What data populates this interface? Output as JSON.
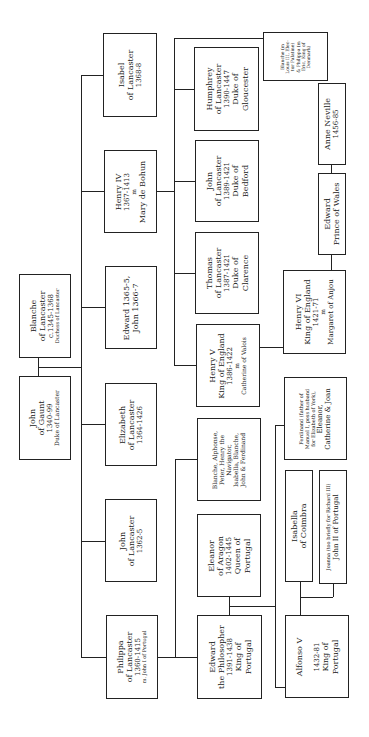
{
  "diagram": {
    "type": "family-tree",
    "orientation": "rotated-90-ccw",
    "line_color": "#222222",
    "background": "#ffffff"
  },
  "generation1": {
    "john_of_gaunt": {
      "lines": [
        "John",
        "of Gaunt",
        "1340-99",
        "Duke of Lancaster"
      ]
    },
    "blanche": {
      "lines": [
        "Blanche",
        "of Lancaster",
        "c.1345-1368",
        "Duchess of Lancaster"
      ]
    }
  },
  "generation2": {
    "philippa": {
      "lines": [
        "Philippa",
        "of Lancaster",
        "1360-1415"
      ],
      "note": "m. John I of Portugal"
    },
    "john_1362": {
      "lines": [
        "John",
        "of Lancaster",
        "1362-5"
      ]
    },
    "elizabeth": {
      "lines": [
        "Elizabeth",
        "of Lancaster",
        "1364-1426"
      ]
    },
    "edward_john": {
      "lines": [
        "Edward 1365-5,",
        "John 1366-7"
      ]
    },
    "henry_iv": {
      "lines": [
        "Henry IV",
        "1367-1413",
        "m",
        "Mary de Bohun"
      ]
    },
    "isabel": {
      "lines": [
        "Isabel",
        "of Lancaster",
        "1368-8"
      ]
    }
  },
  "generation3": {
    "edward_philosopher": {
      "lines": [
        "Edward",
        "the Philosopher",
        "1391-1438",
        "King of",
        "Portugal"
      ]
    },
    "eleanor_aragon": {
      "lines": [
        "Eleanor",
        "of Aragon",
        "1402-1445",
        "Queen of",
        "Portugal"
      ]
    },
    "portugal_siblings": {
      "lines": [
        "Blanche, Alphonse,",
        "Peter, Henry the",
        "Navigator,",
        "Isabella, Blanche,",
        "John & Ferdinand"
      ]
    },
    "henry_v": {
      "lines": [
        "Henry V",
        "King of England",
        "1386-1422",
        "m",
        "Catherine of Valois"
      ]
    },
    "thomas": {
      "lines": [
        "Thomas",
        "of Lancaster",
        "1387-1421",
        "Duke of",
        "Clarence"
      ]
    },
    "john_bedford": {
      "lines": [
        "John",
        "of Lancaster",
        "1389-1421",
        "Duke of",
        "Bedford"
      ]
    },
    "humphrey": {
      "lines": [
        "Humphrey",
        "of Lancaster",
        "1390-1447",
        "Duke of",
        "Gloucester"
      ]
    },
    "blanche_philippa": {
      "lines": [
        "Blanche (m",
        "Louis III, Elec-",
        "tor Palatine)",
        "& Philippa (m",
        "Eric, King of",
        "Denmark)"
      ]
    }
  },
  "generation4": {
    "alfonso_v": {
      "lines": [
        "Alfonso V",
        "",
        "1432-81",
        "King of",
        "Portugal"
      ]
    },
    "isabella_coimbra": {
      "lines": [
        "Isabella",
        "of Coimbra"
      ]
    },
    "joanna": {
      "lines": [
        "Joanna (too briefly for Richard III)",
        "John II of Portugal"
      ]
    },
    "ferdinand_etc": {
      "lines": [
        "Ferdinand (father of",
        "Manuel I, poss husband",
        "for Elizabeth of York),",
        "Eleanor,",
        "Catherine & Joan"
      ]
    },
    "henry_vi": {
      "lines": [
        "Henry VI",
        "King of England",
        "1421-71",
        "m",
        "Margaret of Anjou"
      ]
    },
    "edward_prince": {
      "lines": [
        "Edward",
        "Prince of Wales"
      ]
    },
    "anne_neville": {
      "lines": [
        "Anne Neville",
        "1456-85"
      ]
    }
  }
}
